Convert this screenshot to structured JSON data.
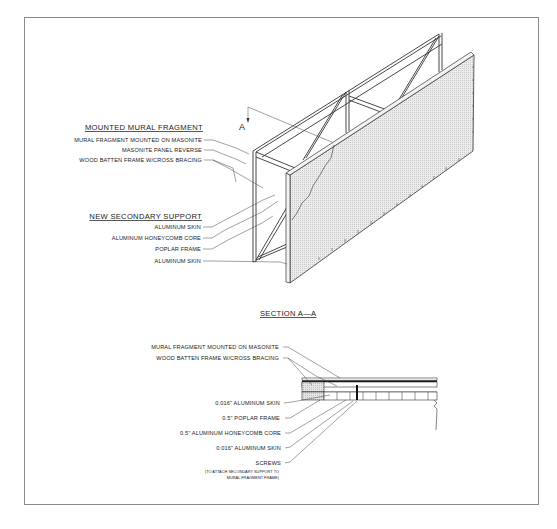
{
  "drawing": {
    "isometric_view": {
      "section_marker": "A",
      "groups": [
        {
          "heading": "MOUNTED MURAL FRAGMENT",
          "callouts": [
            "MURAL FRAGMENT MOUNTED ON MASONITE",
            "MASONITE PANEL REVERSE",
            "WOOD BATTEN FRAME W/CROSS BRACING"
          ]
        },
        {
          "heading": "NEW SECONDARY SUPPORT",
          "callouts": [
            "ALUMINUM SKIN",
            "ALUMINUM HONEYCOMB CORE",
            "POPLAR FRAME",
            "ALUMINUM SKIN"
          ]
        }
      ]
    },
    "section_view": {
      "title": "SECTION A—A",
      "callouts": [
        "MURAL FRAGMENT MOUNTED ON MASONITE",
        "WOOD BATTEN FRAME W/CROSS BRACING",
        "0.016\" ALUMINUM SKIN",
        "0.5\" POPLAR FRAME",
        "0.5\" ALUMINUM HONEYCOMB CORE",
        "0.016\" ALUMINUM SKIN",
        "SCREWS"
      ],
      "screws_note": [
        "(TO ATTACH SECONDARY SUPPORT TO",
        "MURAL FRAGMENT FRAME)"
      ]
    }
  }
}
